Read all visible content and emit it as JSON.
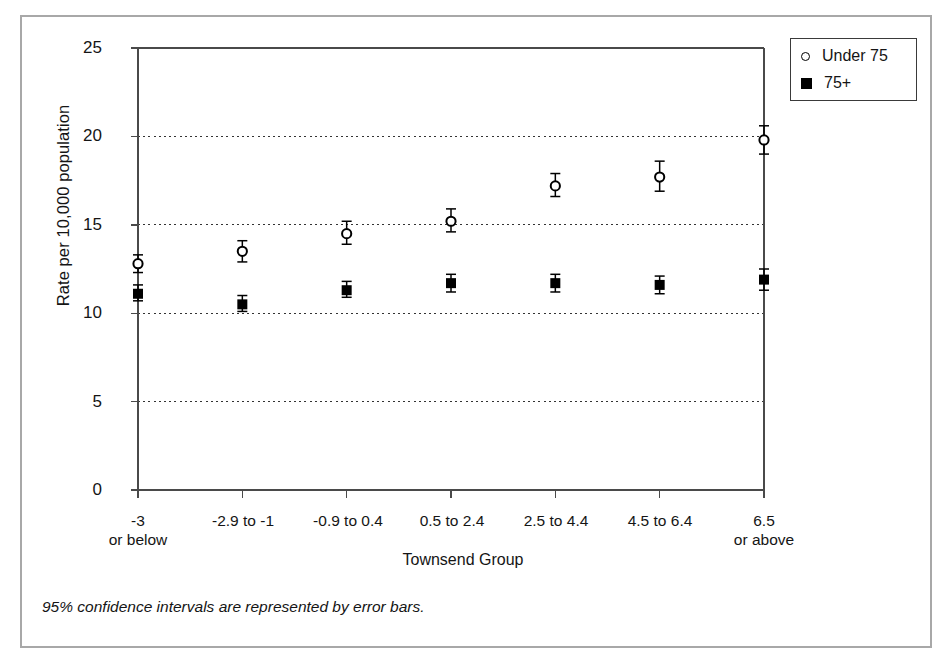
{
  "chart_data": {
    "type": "scatter",
    "title": "",
    "xlabel": "Townsend Group",
    "ylabel": "Rate per 10,000 population",
    "ylim": [
      0,
      25
    ],
    "yticks": [
      0,
      5,
      10,
      15,
      20,
      25
    ],
    "grid": "horizontal dotted gridlines at 5, 10, 15, 20",
    "legend_position": "top-right outside plot",
    "categories": [
      "-3\nor below",
      "-2.9 to -1",
      "-0.9 to 0.4",
      "0.5 to 2.4",
      "2.5 to 4.4",
      "4.5 to 6.4",
      "6.5\nor above"
    ],
    "category_lines": [
      [
        "-3",
        "or below"
      ],
      [
        "-2.9 to -1",
        ""
      ],
      [
        "-0.9 to 0.4",
        ""
      ],
      [
        "0.5 to 2.4",
        ""
      ],
      [
        "2.5 to 4.4",
        ""
      ],
      [
        "4.5 to 6.4",
        ""
      ],
      [
        "6.5",
        "or above"
      ]
    ],
    "series": [
      {
        "name": "Under 75",
        "marker": "open-circle",
        "color": "#000000",
        "values": [
          12.8,
          13.5,
          14.5,
          15.2,
          17.2,
          17.7,
          19.8
        ],
        "ci_low": [
          12.3,
          12.9,
          13.9,
          14.6,
          16.6,
          16.9,
          19.0
        ],
        "ci_high": [
          13.3,
          14.1,
          15.2,
          15.9,
          17.9,
          18.6,
          20.6
        ]
      },
      {
        "name": "75+",
        "marker": "filled-square",
        "color": "#000000",
        "values": [
          11.1,
          10.5,
          11.3,
          11.7,
          11.7,
          11.6,
          11.9
        ],
        "ci_low": [
          10.7,
          10.1,
          10.9,
          11.2,
          11.2,
          11.1,
          11.3
        ],
        "ci_high": [
          11.6,
          11.0,
          11.8,
          12.2,
          12.2,
          12.1,
          12.5
        ]
      }
    ],
    "annotations": [
      "95% confidence intervals are represented by error bars."
    ]
  },
  "legend": {
    "items": [
      {
        "label": "Under 75",
        "marker": "open-circle"
      },
      {
        "label": "75+",
        "marker": "filled-square"
      }
    ]
  },
  "axis": {
    "y_title": "Rate per 10,000 population",
    "x_title": "Townsend Group",
    "y_tick_labels": [
      "25",
      "20",
      "15",
      "10",
      "5",
      "0"
    ]
  },
  "footnote": {
    "text": "95% confidence intervals are represented by error bars."
  },
  "style": {
    "frame_color": "#a8a8a8",
    "axis_color": "#4a4a4a",
    "grid_color": "#333333",
    "marker_color": "#000000",
    "background": "#ffffff"
  }
}
